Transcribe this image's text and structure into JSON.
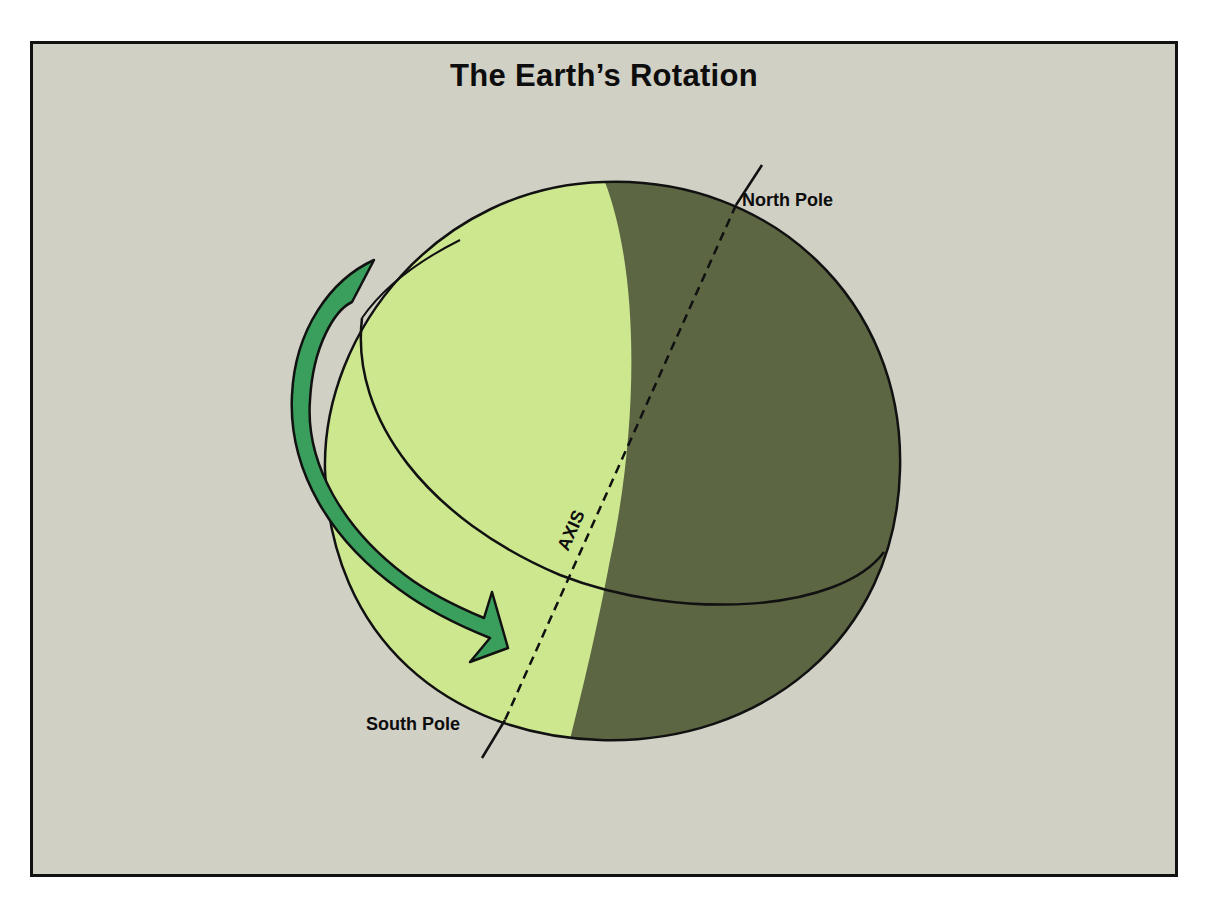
{
  "title": "The Earth’s Rotation",
  "labels": {
    "north_pole": "North Pole",
    "south_pole": "South Pole",
    "axis": "AXIS"
  },
  "colors": {
    "background": "#d1d0c5",
    "day_side": "#cde78f",
    "night_side": "#5c6643",
    "arrow": "#3a9e5c",
    "outline": "#111111"
  },
  "icons": {
    "rotation_arrow": "curved-arrow-counterclockwise-to-east"
  }
}
